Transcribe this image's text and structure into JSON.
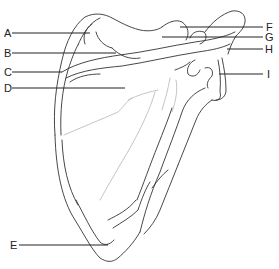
{
  "diagram": {
    "view": "posterior",
    "labels": [
      {
        "letter": "A",
        "side": "left",
        "x": 4,
        "y": 27,
        "line_y": 33,
        "line_x1": 12,
        "line_x2": 90
      },
      {
        "letter": "B",
        "side": "left",
        "x": 4,
        "y": 47,
        "line_y": 53,
        "line_x1": 12,
        "line_x2": 116
      },
      {
        "letter": "C",
        "side": "left",
        "x": 4,
        "y": 66,
        "line_y": 72,
        "line_x1": 12,
        "line_x2": 62
      },
      {
        "letter": "D",
        "side": "left",
        "x": 4,
        "y": 82,
        "line_y": 88,
        "line_x1": 12,
        "line_x2": 125
      },
      {
        "letter": "E",
        "side": "left",
        "x": 10,
        "y": 239,
        "line_y": 245,
        "line_x1": 19,
        "line_x2": 108
      },
      {
        "letter": "F",
        "side": "right",
        "x": 266,
        "y": 21,
        "line_y": 27,
        "line_x1": 180,
        "line_x2": 263
      },
      {
        "letter": "G",
        "side": "right",
        "x": 265,
        "y": 31,
        "line_y": 37,
        "line_x1": 162,
        "line_x2": 263
      },
      {
        "letter": "H",
        "side": "right",
        "x": 265,
        "y": 43,
        "line_y": 49,
        "line_x1": 227,
        "line_x2": 263
      },
      {
        "letter": "I",
        "side": "right",
        "x": 267,
        "y": 68,
        "line_y": 74,
        "line_x1": 219,
        "line_x2": 263
      }
    ],
    "colors": {
      "outline": "#333333",
      "detail": "#b0b0b0",
      "leader": "#222222"
    }
  }
}
